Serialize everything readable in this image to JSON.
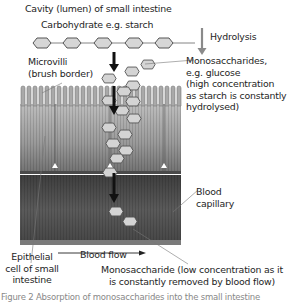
{
  "diagram": {
    "labels": {
      "cavity": "Cavity (lumen) of small intestine",
      "carbohydrate": "Carbohydrate e.g. starch",
      "hydrolysis": "Hydrolysis",
      "microvilli_line1": "Microvilli",
      "microvilli_line2": "(brush border)",
      "mono_high_line1": "Monosaccharides,",
      "mono_high_line2": "e.g. glucose",
      "mono_high_line3": "(high concentration",
      "mono_high_line4": "as starch is constantly",
      "mono_high_line5": "hydrolysed)",
      "capillary_line1": "Blood",
      "capillary_line2": "capillary",
      "blood_flow": "Blood flow",
      "epithelial_line1": "Epithelial",
      "epithelial_line2": "cell of small",
      "epithelial_line3": "intestine",
      "mono_low_line1": "Monosaccharide (low concentration as it",
      "mono_low_line2": "is constantly removed by blood flow)",
      "caption": "Figure 2  Absorption of monosaccharides into the small intestine"
    },
    "colors": {
      "hexagon_fill": "#d4d4d4",
      "hexagon_stroke": "#555555",
      "epithelium_light": "#b8b8b8",
      "epithelium_dark": "#6e6e6e",
      "capillary": "#4a4a4a",
      "arrow": "#111111",
      "hydrolysis_arrow": "#8a8a8a"
    }
  }
}
